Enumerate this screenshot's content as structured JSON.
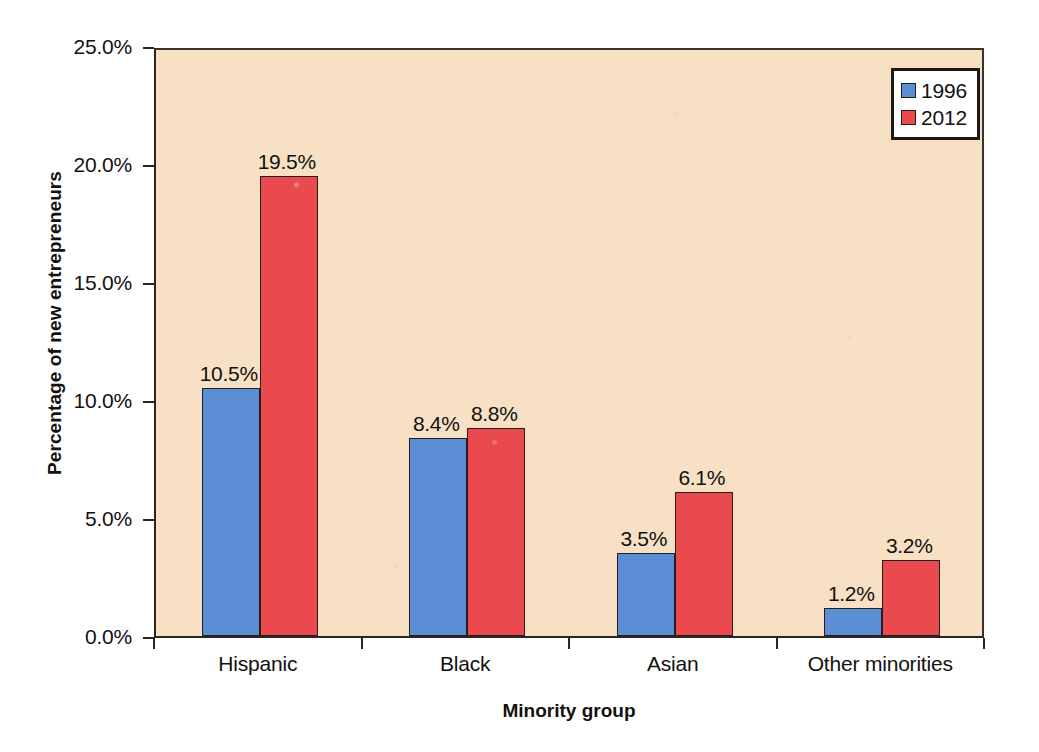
{
  "chart_data": {
    "type": "bar",
    "title": "",
    "xlabel": "Minority group",
    "ylabel": "Percentage of new entrepreneurs",
    "categories": [
      "Hispanic",
      "Black",
      "Asian",
      "Other minorities"
    ],
    "series": [
      {
        "name": "1996",
        "color": "#5c8ed6",
        "values": [
          10.5,
          8.4,
          3.5,
          1.2
        ],
        "data_labels": [
          "10.5%",
          "8.4%",
          "3.5%",
          "1.2%"
        ]
      },
      {
        "name": "2012",
        "color": "#ea4a4e",
        "values": [
          19.5,
          8.8,
          6.1,
          3.2
        ],
        "data_labels": [
          "19.5%",
          "8.8%",
          "6.1%",
          "3.2%"
        ]
      }
    ],
    "ylim": [
      0,
      25
    ],
    "ytick_values": [
      25.0,
      20.0,
      15.0,
      10.0,
      5.0,
      0.0
    ],
    "ytick_labels": [
      "25.0%",
      "20.0%",
      "15.0%",
      "10.0%",
      "5.0%",
      "0.0%"
    ],
    "grid": false,
    "legend_position": "top-right",
    "legend_entries": [
      "1996",
      "2012"
    ],
    "plot_background_color": "#f7e0c4",
    "page_background_color": "#ffffff",
    "axis_color": "#2a2522"
  }
}
